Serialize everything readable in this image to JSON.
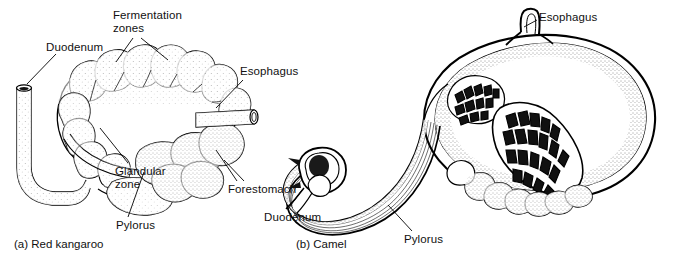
{
  "figure": {
    "kind": "anatomical-line-drawing",
    "background_color": "#ffffff",
    "ink_color": "#000000",
    "panels": [
      {
        "id": "a",
        "caption": "(a) Red kangaroo",
        "labels": [
          "Fermentation\nzones",
          "Duodenum",
          "Esophagus",
          "Glandular\nzone",
          "Forestomach",
          "Pylorus"
        ]
      },
      {
        "id": "b",
        "caption": "(b) Camel",
        "labels": [
          "Esophagus",
          "Duodenum",
          "Pylorus"
        ]
      }
    ]
  },
  "labels": {
    "fermentation_zones": "Fermentation\nzones",
    "duodenum_a": "Duodenum",
    "esophagus_a": "Esophagus",
    "glandular_zone": "Glandular\nzone",
    "forestomach": "Forestomach",
    "pylorus_a": "Pylorus",
    "esophagus_b": "Esophagus",
    "duodenum_b": "Duodenum",
    "pylorus_b": "Pylorus"
  },
  "captions": {
    "panel_a": "(a) Red kangaroo",
    "panel_b": "(b) Camel"
  }
}
